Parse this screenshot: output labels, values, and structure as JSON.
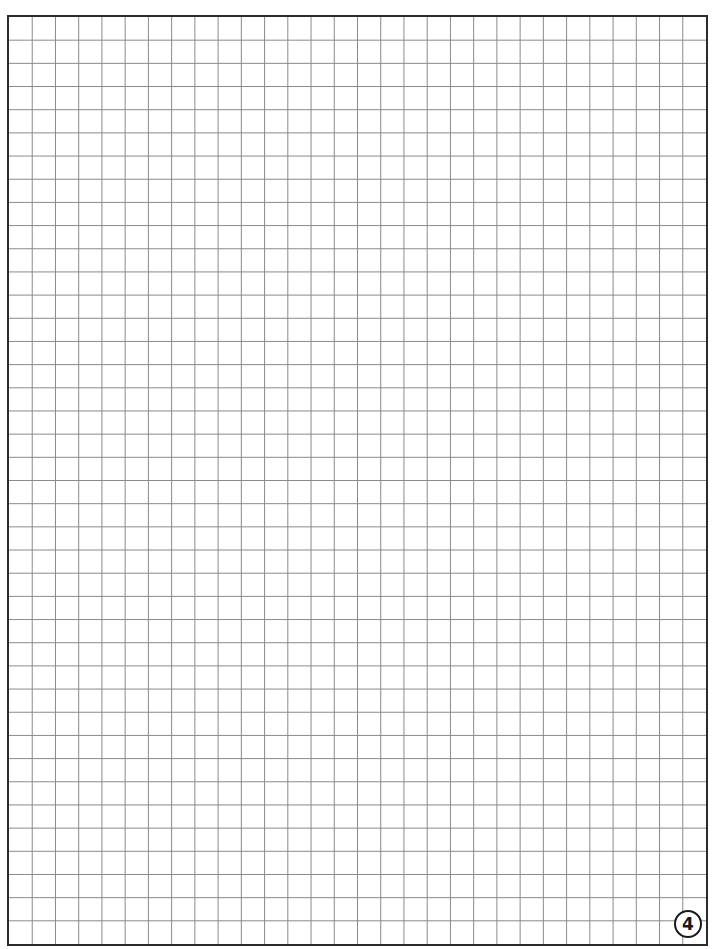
{
  "sheet": {
    "type": "graph-paper",
    "columns": 30,
    "rows": 40,
    "line_color": "#8a8a8a",
    "border_color": "#2b2b2b",
    "background": "#ffffff"
  },
  "page_number": "4"
}
